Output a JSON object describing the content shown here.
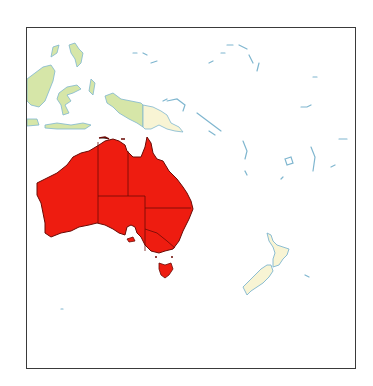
{
  "map": {
    "region": "Oceania",
    "highlighted_country": "Australia",
    "colors": {
      "highlight": "#ee1c10",
      "highlight_border": "#6b0a05",
      "neighbor_green": "#d6e6a8",
      "neighbor_cream": "#f8f4d4",
      "coast": "#7fb6cf",
      "frame": "#3a3a3a",
      "water": "#ffffff"
    },
    "features": [
      {
        "name": "Australia",
        "style": "highlight",
        "subdivisions": [
          "Western Australia",
          "Northern Territory",
          "Queensland",
          "South Australia",
          "New South Wales",
          "Victoria",
          "Tasmania"
        ]
      },
      {
        "name": "Indonesia",
        "style": "neighbor_green"
      },
      {
        "name": "Papua New Guinea",
        "style": "neighbor_cream"
      },
      {
        "name": "New Zealand",
        "style": "neighbor_cream"
      },
      {
        "name": "Pacific islands",
        "style": "coast-outline"
      }
    ]
  }
}
